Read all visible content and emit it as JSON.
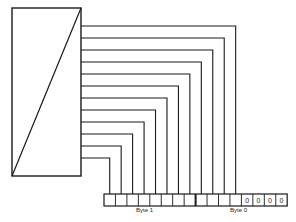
{
  "diagram": {
    "converter_box": {
      "x": 12,
      "y": 8,
      "width": 69,
      "height": 168,
      "symbol": "diagonal-slash"
    },
    "wire_count": 12,
    "wire_start_y": 26,
    "wire_spacing": 12,
    "register": {
      "x": 104,
      "y": 194,
      "height": 12,
      "cell_count": 16,
      "cell_width": 11.45,
      "byte_boundary_after_cell": 8,
      "fixed_cells": [
        "0",
        "0",
        "0",
        "0"
      ]
    },
    "labels": {
      "byte1": "Byte 1",
      "byte0": "Byte 0"
    },
    "colors": {
      "line": "#1a1a1a",
      "background": "#ffffff"
    }
  }
}
